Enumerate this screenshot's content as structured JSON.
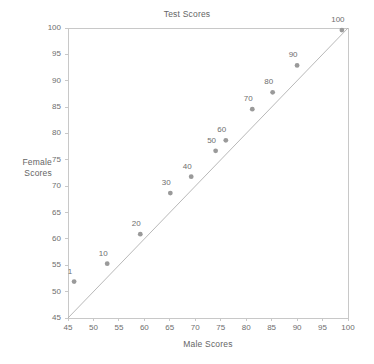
{
  "chart_data": {
    "type": "scatter",
    "title": "Test Scores",
    "xlabel": "Male Scores",
    "ylabel": "Female Scores",
    "ylabel_lines": [
      "Female",
      "Scores"
    ],
    "xlim": [
      45,
      100
    ],
    "ylim": [
      45,
      100
    ],
    "xticks": [
      45,
      50,
      55,
      60,
      65,
      70,
      75,
      80,
      85,
      90,
      95,
      100
    ],
    "yticks": [
      45,
      50,
      55,
      60,
      65,
      70,
      75,
      80,
      85,
      90,
      95,
      100
    ],
    "grid": false,
    "legend": "none",
    "reference_line": {
      "name": "identity-line",
      "from": [
        45,
        45
      ],
      "to": [
        100,
        100
      ],
      "color": "#b0b0b0"
    },
    "marker_color": "#9a9a9a",
    "axis_color": "#c8c8c8",
    "text_color": "#6e6e6e",
    "point_label_position": "above-left",
    "points": [
      {
        "label": "1",
        "x": 46.2,
        "y": 51.9
      },
      {
        "label": "10",
        "x": 52.7,
        "y": 55.3
      },
      {
        "label": "20",
        "x": 59.2,
        "y": 60.9
      },
      {
        "label": "30",
        "x": 65.1,
        "y": 68.7
      },
      {
        "label": "40",
        "x": 69.2,
        "y": 71.8
      },
      {
        "label": "50",
        "x": 74.0,
        "y": 76.7
      },
      {
        "label": "60",
        "x": 76.0,
        "y": 78.7
      },
      {
        "label": "70",
        "x": 81.2,
        "y": 84.6
      },
      {
        "label": "80",
        "x": 85.2,
        "y": 87.8
      },
      {
        "label": "90",
        "x": 90.0,
        "y": 92.9
      },
      {
        "label": "100",
        "x": 98.8,
        "y": 99.6
      }
    ]
  }
}
